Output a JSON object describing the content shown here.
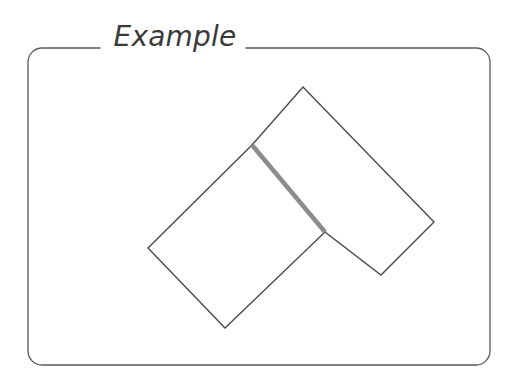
{
  "panel": {
    "title": "Example",
    "border_color": "#5a5a5a",
    "border_width": 1.3,
    "corner_radius": 14,
    "background": "#ffffff",
    "frame": {
      "x": 28,
      "y": 48,
      "width": 462,
      "height": 317
    },
    "title_gap": {
      "start_x": 100,
      "end_x": 246
    }
  },
  "figure": {
    "stroke_color": "#4a4a4a",
    "stroke_width": 1.4,
    "highlight_color": "#8c8c8c",
    "highlight_width": 4.5,
    "fill": "none",
    "shapes": [
      {
        "name": "left-quadrilateral",
        "points": "252,145 148,248 225,328 325,232",
        "stroke": "#4a4a4a",
        "fill": "none"
      },
      {
        "name": "right-quadrilateral",
        "points": "252,145 303,87 434,222 381,275 325,232",
        "stroke": "#4a4a4a",
        "fill": "none"
      }
    ],
    "shared_edge": {
      "name": "shared-edge-highlight",
      "x1": 252,
      "y1": 145,
      "x2": 325,
      "y2": 232,
      "color": "#8c8c8c",
      "width": 4.5
    }
  }
}
